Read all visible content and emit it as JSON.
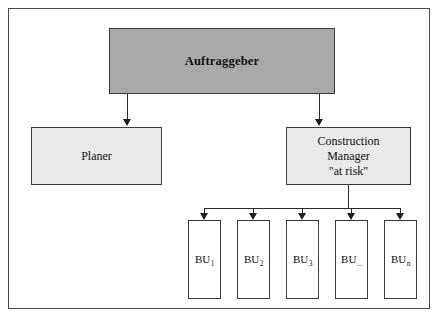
{
  "diagram": {
    "type": "organizational-hierarchy",
    "colors": {
      "client_box_fill": "#a9a9a9",
      "secondary_box_fill": "#e9e9e9",
      "unit_box_fill": "#ffffff",
      "border": "#3a3a3a",
      "frame_border": "#4a4a4a",
      "connector": "#2b2b2b",
      "text": "#111111"
    },
    "nodes": {
      "client": {
        "label": "Auftraggeber",
        "level": 1
      },
      "planner": {
        "label": "Planer",
        "level": 2
      },
      "construction_manager": {
        "line1": "Construction",
        "line2": "Manager",
        "line3": "\"at risk\"",
        "level": 2
      }
    },
    "business_units": [
      {
        "base": "BU",
        "subscript": "1"
      },
      {
        "base": "BU",
        "subscript": "2"
      },
      {
        "base": "BU",
        "subscript": "3"
      },
      {
        "base": "BU",
        "subscript": "..."
      },
      {
        "base": "BU",
        "subscript": "n"
      }
    ],
    "connections": [
      {
        "from": "client",
        "to": "planner",
        "style": "arrow"
      },
      {
        "from": "client",
        "to": "construction_manager",
        "style": "arrow"
      },
      {
        "from": "construction_manager",
        "to": "business_units",
        "style": "bus-arrow"
      }
    ]
  }
}
